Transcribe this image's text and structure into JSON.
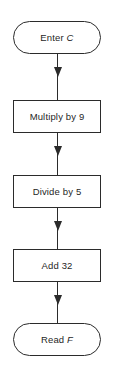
{
  "diagram": {
    "orientation": "vertical",
    "stroke_color": "#2b2b2b",
    "background_color": "#ffffff",
    "text_color": "#1f1f1f",
    "nodes": [
      {
        "id": "start",
        "shape": "terminal",
        "label_prefix": "Enter ",
        "label_variable": "C",
        "label_suffix": "",
        "full_text": "Enter C"
      },
      {
        "id": "multiply",
        "shape": "process",
        "label_prefix": "Multiply by 9",
        "label_variable": "",
        "label_suffix": "",
        "full_text": "Multiply by 9"
      },
      {
        "id": "divide",
        "shape": "process",
        "label_prefix": "Divide by 5",
        "label_variable": "",
        "label_suffix": "",
        "full_text": "Divide by 5"
      },
      {
        "id": "add",
        "shape": "process",
        "label_prefix": "Add 32",
        "label_variable": "",
        "label_suffix": "",
        "full_text": "Add 32"
      },
      {
        "id": "end",
        "shape": "terminal",
        "label_prefix": "Read ",
        "label_variable": "F",
        "label_suffix": "",
        "full_text": "Read F"
      }
    ],
    "connectors": [
      {
        "id": "start-to-multiply",
        "from": "start",
        "to": "multiply",
        "arrowhead": "solid-triangle"
      },
      {
        "id": "multiply-to-divide",
        "from": "multiply",
        "to": "divide",
        "arrowhead": "solid-triangle"
      },
      {
        "id": "divide-to-add",
        "from": "divide",
        "to": "add",
        "arrowhead": "solid-triangle"
      },
      {
        "id": "add-to-end",
        "from": "add",
        "to": "end",
        "arrowhead": "solid-triangle"
      }
    ]
  }
}
